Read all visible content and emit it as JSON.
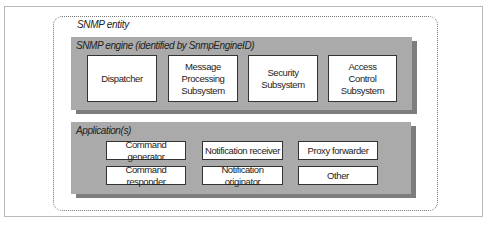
{
  "entity": {
    "label": "SNMP entity"
  },
  "engine": {
    "label": "SNMP engine (identified by SnmpEngineID)",
    "subsystems": [
      {
        "label": "Dispatcher"
      },
      {
        "label": "Message\nProcessing\nSubsystem"
      },
      {
        "label": "Security\nSubsystem"
      },
      {
        "label": "Access\nControl\nSubsystem"
      }
    ]
  },
  "applications": {
    "label": "Application(s)",
    "items": [
      {
        "label": "Command generator"
      },
      {
        "label": "Notification receiver"
      },
      {
        "label": "Proxy forwarder"
      },
      {
        "label": "Command responder"
      },
      {
        "label": "Notification originator"
      },
      {
        "label": "Other"
      }
    ]
  },
  "colors": {
    "panel": "#aaaaaa",
    "panel_shadow": "#7d7d7d",
    "box_border": "#333333"
  }
}
